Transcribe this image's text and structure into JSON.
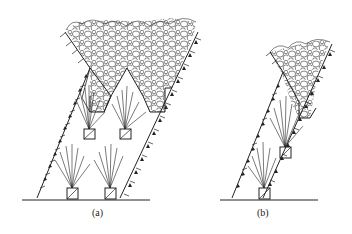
{
  "figure": {
    "panels": [
      {
        "id": "a",
        "label": "(a)"
      },
      {
        "id": "b",
        "label": "(b)"
      }
    ],
    "colors": {
      "line": "#222222",
      "background": "#ffffff"
    }
  }
}
